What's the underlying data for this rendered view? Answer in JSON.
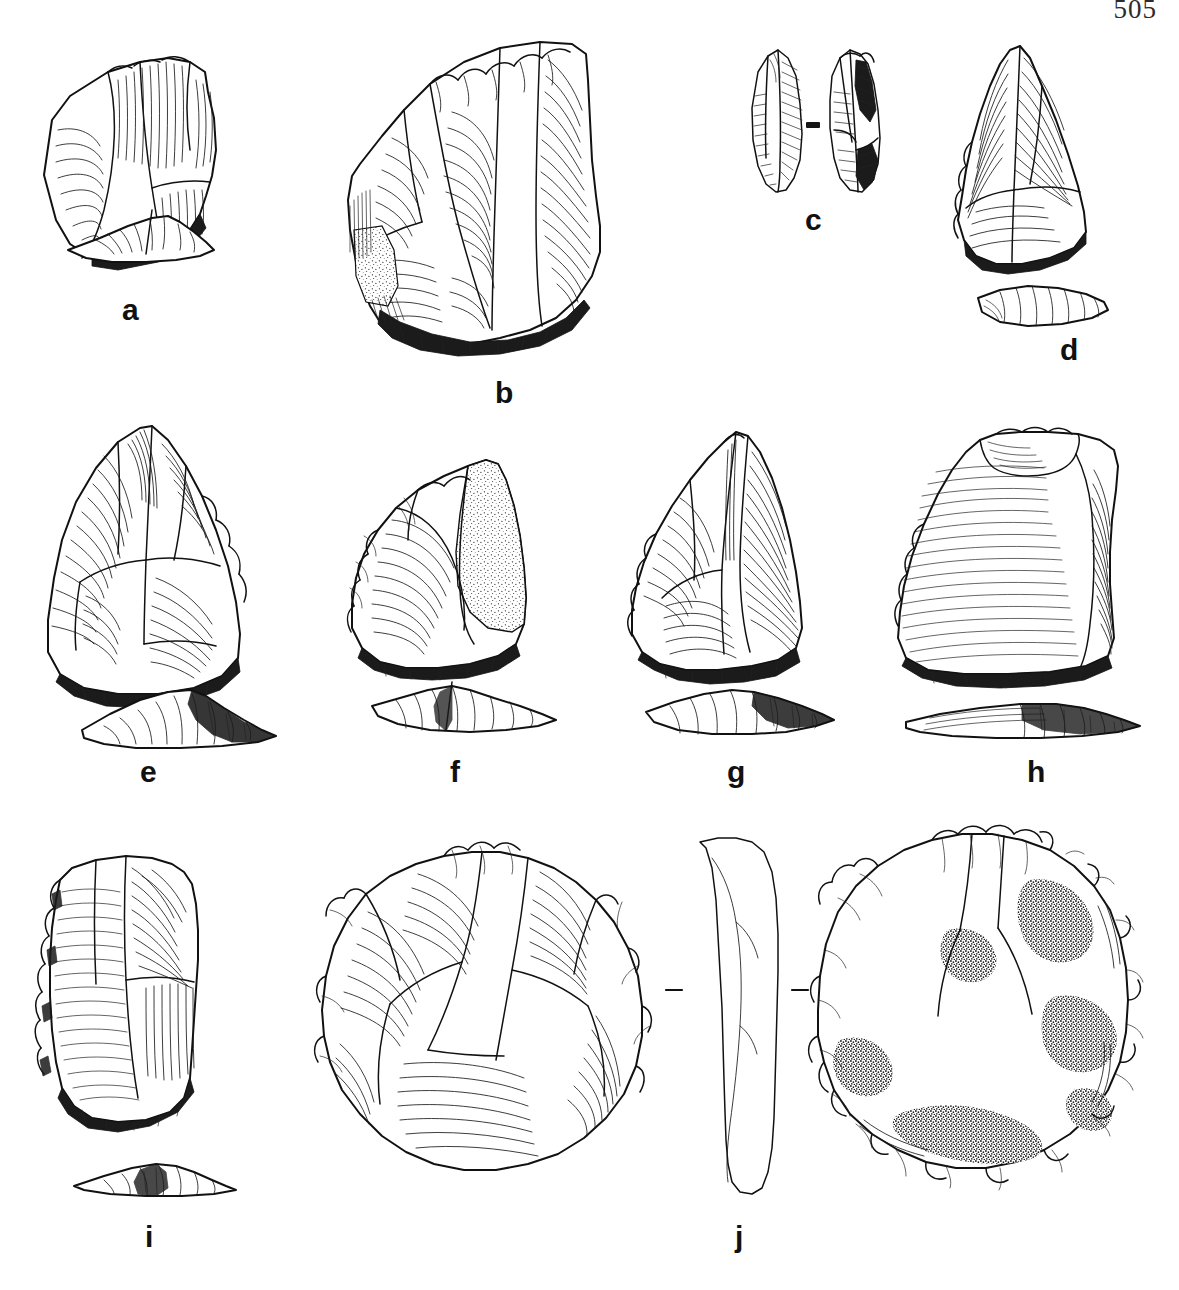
{
  "document": {
    "type": "archaeological-lithic-illustration-plate",
    "page_number": "505",
    "medium": "pen-and-ink line drawing",
    "ink_color": "#111111",
    "background_color": "#ffffff"
  },
  "figure": {
    "caption": "",
    "specimen_count": 10,
    "rows": [
      {
        "row": 1,
        "labels": [
          "a",
          "b",
          "c",
          "d"
        ]
      },
      {
        "row": 2,
        "labels": [
          "e",
          "f",
          "g",
          "h"
        ]
      },
      {
        "row": 3,
        "labels": [
          "i",
          "j"
        ]
      }
    ]
  },
  "specimens": [
    {
      "label": "a",
      "row": 1,
      "description": "flake tool with retouched edge, plan view with separate profile section below",
      "views": [
        "plan",
        "profile"
      ],
      "features": [
        "ripple-hatching",
        "retouched-edge",
        "flake-scars"
      ],
      "label_position": {
        "x": 122,
        "y": 295
      }
    },
    {
      "label": "b",
      "row": 1,
      "description": "large Levallois flake with denticulated dorsal crest and cortical patch",
      "views": [
        "plan"
      ],
      "features": [
        "ripple-hatching",
        "stippled-cortex",
        "denticulate-retouch",
        "striking-platform"
      ],
      "label_position": {
        "x": 495,
        "y": 378
      }
    },
    {
      "label": "c",
      "row": 1,
      "description": "narrow bipointed blade shown in dorsal and ventral views with cross-section bar",
      "views": [
        "dorsal",
        "ventral",
        "cross-section"
      ],
      "features": [
        "parallel-hatching",
        "median-ridge",
        "cross-section-bar"
      ],
      "label_position": {
        "x": 805,
        "y": 205
      }
    },
    {
      "label": "d",
      "row": 1,
      "description": "triangular point with steeply retouched left edge, plan and profile",
      "views": [
        "plan",
        "profile"
      ],
      "features": [
        "ripple-hatching",
        "scalar-retouch"
      ],
      "label_position": {
        "x": 1060,
        "y": 335
      }
    },
    {
      "label": "e",
      "row": 2,
      "description": "broad triangular Levallois point with multidirectional flake scars, plan and profile",
      "views": [
        "plan",
        "profile"
      ],
      "features": [
        "ripple-hatching",
        "flake-scars",
        "retouched-edge"
      ],
      "label_position": {
        "x": 140,
        "y": 757
      }
    },
    {
      "label": "f",
      "row": 2,
      "description": "convergent scraper with stippled cortical surface, plan and profile",
      "views": [
        "plan",
        "profile"
      ],
      "features": [
        "stippled-cortex",
        "ripple-hatching",
        "scalar-retouch"
      ],
      "label_position": {
        "x": 450,
        "y": 757
      }
    },
    {
      "label": "g",
      "row": 2,
      "description": "tall triangular point with prominent dorsal ridge, plan and profile",
      "views": [
        "plan",
        "profile"
      ],
      "features": [
        "dorsal-ridge",
        "ripple-hatching",
        "basal-retouch"
      ],
      "label_position": {
        "x": 727,
        "y": 757
      }
    },
    {
      "label": "h",
      "row": 2,
      "description": "broad flake with notched platform and fine horizontal ripples, plan and profile",
      "views": [
        "plan",
        "profile"
      ],
      "features": [
        "fine-ripple-hatching",
        "notched-platform"
      ],
      "label_position": {
        "x": 1027,
        "y": 757
      }
    },
    {
      "label": "i",
      "row": 3,
      "description": "rectangular side-scraper with continuous retouch on left edge, plan and profile",
      "views": [
        "plan",
        "profile"
      ],
      "features": [
        "ripple-hatching",
        "continuous-retouch",
        "oblique-hatching"
      ],
      "label_position": {
        "x": 145,
        "y": 1222
      }
    },
    {
      "label": "j",
      "row": 3,
      "description": "large discoid core with heavy cortical stippling, shown in face view with side profile and section ticks",
      "views": [
        "face",
        "profile"
      ],
      "features": [
        "stippled-cortex",
        "scalloped-retouch-edge",
        "radial-flake-scars",
        "section-ticks"
      ],
      "label_position": {
        "x": 735,
        "y": 1222
      }
    }
  ],
  "unlabeled_elements": [
    {
      "name": "discoidal-core-plan",
      "description": "large circular discoidal core with radial flake scars, positioned between specimens i and j"
    }
  ]
}
